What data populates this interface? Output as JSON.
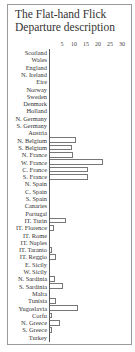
{
  "chart_data": {
    "type": "bar",
    "orientation": "horizontal",
    "title": "The Flat-hand Flick Departure description",
    "title_lines": [
      "The Flat-hand Flick",
      "Departure description"
    ],
    "xlabel": "",
    "ylabel": "",
    "xlim": [
      0,
      30
    ],
    "x_ticks": [
      5,
      10,
      15,
      20,
      25,
      30
    ],
    "grid": false,
    "legend": null,
    "categories": [
      "Scotland",
      "Wales",
      "England",
      "N. Ireland",
      "Eire",
      "Norway",
      "Sweden",
      "Denmark",
      "Holland",
      "N. Germany",
      "S. Germany",
      "Austria",
      "N. Belgium",
      "S. Belgium",
      "N. France",
      "W. France",
      "C. France",
      "S. France",
      "N. Spain",
      "C. Spain",
      "S. Spain",
      "Canaries",
      "Portugal",
      "IT. Turin",
      "IT. Florence",
      "IT. Rome",
      "IT. Naples",
      "IT. Taranto",
      "IT. Reggio",
      "E. Sicily",
      "W. Sicily",
      "N. Sardinia",
      "S. Sardinia",
      "Malta",
      "Tunisia",
      "Yugoslavia",
      "Corfu",
      "N. Greece",
      "S. Greece",
      "Turkey"
    ],
    "values": [
      0,
      0,
      0,
      0,
      0,
      0,
      0,
      0,
      0,
      0,
      0,
      0,
      11,
      9,
      9.5,
      22,
      16,
      16,
      0,
      0,
      0,
      0,
      0,
      6.5,
      1.5,
      0,
      0,
      1,
      2.5,
      0,
      0,
      2,
      5.5,
      0,
      2.5,
      11.5,
      1,
      4,
      1,
      0
    ]
  },
  "layout": {
    "x_origin_px": 50,
    "px_per_unit": 2.4,
    "row_top_px": 49,
    "row_height_px": 7.3
  },
  "colors": {
    "bar_outline": "#777777",
    "axis": "#555555",
    "frame": "#9a9a9a",
    "text": "#333333"
  }
}
